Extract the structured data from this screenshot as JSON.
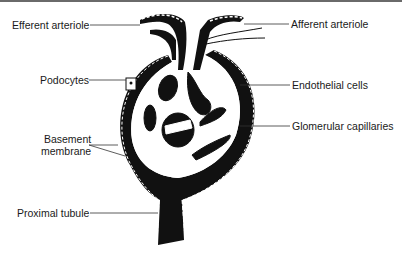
{
  "diagram": {
    "labels": {
      "efferent_arteriole": "Efferent arteriole",
      "afferent_arteriole": "Afferent arteriole",
      "podocytes": "Podocytes",
      "endothelial_cells": "Endothelial cells",
      "glomerular_capillaries": "Glomerular capillaries",
      "basement_membrane_line1": "Basement",
      "basement_membrane_line2": "membrane",
      "proximal_tubule": "Proximal tubule"
    },
    "colors": {
      "fill": "#111111",
      "background": "#ffffff",
      "line": "#333333"
    }
  }
}
